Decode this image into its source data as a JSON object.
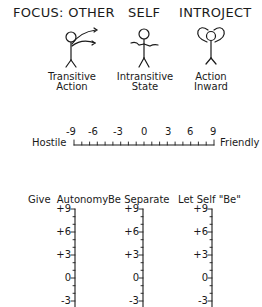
{
  "header": {
    "focus_other": "FOCUS: OTHER",
    "self": "SELF",
    "introject": "INTROJECT"
  },
  "figures": [
    {
      "icon": "stick-figure-arms-reaching-out-icon",
      "caption_line1": "Transitive",
      "caption_line2": "Action"
    },
    {
      "icon": "stick-figure-arms-relaxed-icon",
      "caption_line1": "Intransitive",
      "caption_line2": "State"
    },
    {
      "icon": "stick-figure-arrows-inward-icon",
      "caption_line1": "Action",
      "caption_line2": "Inward"
    }
  ],
  "horizontal_scale": {
    "left_label": "Hostile",
    "right_label": "Friendly",
    "tick_labels": [
      "-9",
      "-6",
      "-3",
      "0",
      "3",
      "6",
      "9"
    ],
    "min": -9,
    "max": 9,
    "minor_step": 1
  },
  "vertical_scales": [
    {
      "title": "Give  Autonomy",
      "tick_labels": [
        "+9",
        "+6",
        "+3",
        "0",
        "-3"
      ]
    },
    {
      "title": "Be Separate",
      "tick_labels": [
        "+9",
        "+6",
        "+3",
        "0",
        "-3"
      ]
    },
    {
      "title": "Let Self \"Be\"",
      "tick_labels": [
        "+9",
        "+6",
        "+3",
        "0",
        "-3"
      ]
    }
  ],
  "colors": {
    "ink": "#1a1a1a",
    "background": "#ffffff"
  }
}
